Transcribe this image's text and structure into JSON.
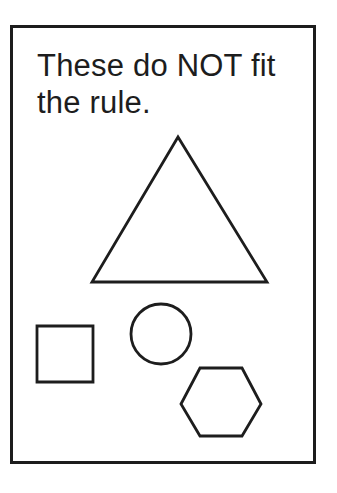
{
  "panel": {
    "caption_line1": "These do NOT fit",
    "caption_line2": "the rule."
  },
  "colors": {
    "line": "#1d1d1d",
    "background": "#ffffff"
  },
  "shapes": {
    "triangle": {
      "name": "triangle",
      "points": "178,137 92,282 267,282"
    },
    "square": {
      "name": "square",
      "points": "37,326 93,326 93,382 37,382"
    },
    "circle": {
      "name": "circle",
      "path": "M 131,334 a 30,30 0 1,0 60,0 a 30,30 0 1,0 -60,0 Z"
    },
    "hexagon": {
      "name": "hexagon",
      "points": "181,404 200,368 242,368 261,404 242,436 200,436"
    }
  }
}
